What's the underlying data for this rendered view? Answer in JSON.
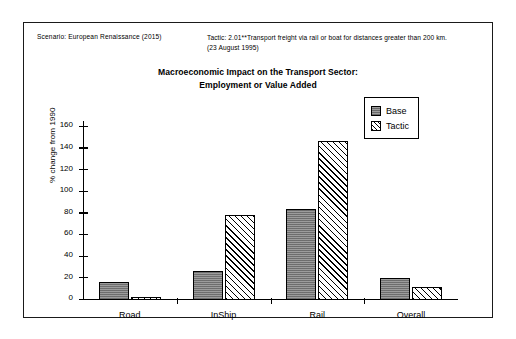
{
  "header": {
    "scenario": "Scenario: European Renaissance (2015)",
    "tactic_line1": "Tactic: 2.01**Transport freight via rail or boat for distances greater than 200 km.",
    "tactic_line2": "(23 August 1995)"
  },
  "legend": {
    "base_label": "Base",
    "tactic_label": "Tactic"
  },
  "colors": {
    "base_fill": "#8c8c8c",
    "tactic_fill": "#ffffff",
    "outline": "#000000",
    "frame": "#1a1a1a",
    "background": "#ffffff"
  },
  "chart_data": {
    "type": "bar",
    "title": "Macroeconomic Impact on the Transport Sector:",
    "subtitle": "Employment or Value Added",
    "xlabel": "",
    "ylabel": "% change from 1990",
    "categories": [
      "Road",
      "InShip",
      "Rail",
      "Overall"
    ],
    "series": [
      {
        "name": "Base",
        "values": [
          17,
          27,
          84,
          20
        ]
      },
      {
        "name": "Tactic",
        "values": [
          3,
          79,
          147,
          12
        ]
      }
    ],
    "ylim": [
      0,
      160
    ],
    "yticks": [
      0,
      20,
      40,
      60,
      80,
      100,
      120,
      140,
      160
    ],
    "ytick_labels": [
      "0",
      "20",
      "40",
      "60",
      "80",
      "100",
      "120",
      "140",
      "160"
    ],
    "grid": false,
    "legend_position": "top-right"
  }
}
